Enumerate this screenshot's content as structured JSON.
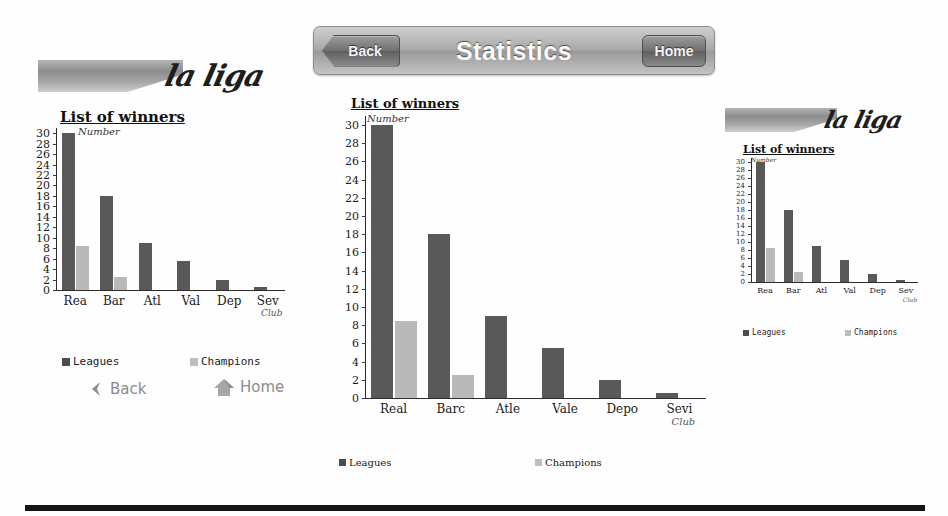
{
  "header": {
    "title": "Statistics",
    "back_label": "Back",
    "home_label": "Home"
  },
  "chart_common": {
    "title": "List of winners",
    "ylabel": "Number",
    "xlabel_note": "Club",
    "legend": {
      "leagues": "Leagues",
      "champions": "Champions"
    },
    "colors": {
      "leagues": "#595959",
      "champions": "#b9b9b9",
      "axis": "#2b2b2b"
    }
  },
  "soft_nav": {
    "back_label": "Back",
    "home_label": "Home"
  },
  "branding": {
    "wordmark": "la liga"
  },
  "chart_data": [
    {
      "id": "left-chart",
      "type": "bar",
      "title": "List of winners",
      "xlabel": "Club",
      "ylabel": "Number",
      "ylim": [
        0,
        31
      ],
      "yticks": [
        0,
        2,
        4,
        6,
        8,
        10,
        12,
        14,
        16,
        18,
        20,
        22,
        24,
        26,
        28,
        30
      ],
      "grid": false,
      "legend_position": "bottom",
      "categories": [
        "Rea",
        "Bar",
        "Atl",
        "Val",
        "Dep",
        "Sev"
      ],
      "series": [
        {
          "name": "Leagues",
          "values": [
            30,
            18,
            9,
            5.5,
            2,
            0.5
          ]
        },
        {
          "name": "Champions",
          "values": [
            8.5,
            2.5,
            0,
            0,
            0,
            0
          ]
        }
      ]
    },
    {
      "id": "center-chart",
      "type": "bar",
      "title": "List of winners",
      "xlabel": "Club",
      "ylabel": "Number",
      "ylim": [
        0,
        31
      ],
      "yticks": [
        0,
        2,
        4,
        6,
        8,
        10,
        12,
        14,
        16,
        18,
        20,
        22,
        24,
        26,
        28,
        30
      ],
      "grid": false,
      "legend_position": "bottom",
      "categories": [
        "Real",
        "Barc",
        "Atle",
        "Vale",
        "Depo",
        "Sevi"
      ],
      "series": [
        {
          "name": "Leagues",
          "values": [
            30,
            18,
            9,
            5.5,
            2,
            0.5
          ]
        },
        {
          "name": "Champions",
          "values": [
            8.5,
            2.5,
            0,
            0,
            0,
            0
          ]
        }
      ]
    },
    {
      "id": "right-chart",
      "type": "bar",
      "title": "List of winners",
      "xlabel": "Club",
      "ylabel": "Number",
      "ylim": [
        0,
        31
      ],
      "yticks": [
        0,
        2,
        4,
        6,
        8,
        10,
        12,
        14,
        16,
        18,
        20,
        22,
        24,
        26,
        28,
        30
      ],
      "grid": false,
      "legend_position": "bottom",
      "categories": [
        "Rea",
        "Bar",
        "Atl",
        "Val",
        "Dep",
        "Sev"
      ],
      "series": [
        {
          "name": "Leagues",
          "values": [
            30,
            18,
            9,
            5.5,
            2,
            0.5
          ]
        },
        {
          "name": "Champions",
          "values": [
            8.5,
            2.5,
            0,
            0,
            0,
            0
          ]
        }
      ]
    }
  ]
}
